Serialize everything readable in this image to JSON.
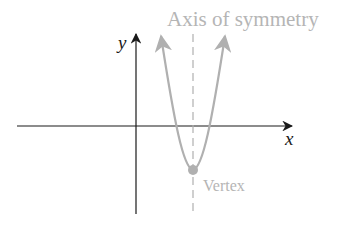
{
  "diagram": {
    "labels": {
      "axis_of_symmetry": "Axis of symmetry",
      "vertex": "Vertex",
      "x_axis": "x",
      "y_axis": "y"
    },
    "colors": {
      "axes": "#1a1a1a",
      "parabola": "#b0b0b0",
      "label": "#b5b5b5",
      "background": "#ffffff"
    }
  }
}
